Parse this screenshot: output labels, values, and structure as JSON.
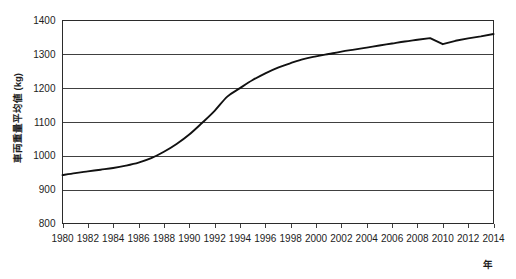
{
  "chart_data": {
    "type": "line",
    "title": "",
    "xlabel": "年",
    "ylabel": "車両重量平均値 (kg)",
    "xlim": [
      1980,
      2014
    ],
    "ylim": [
      800,
      1400
    ],
    "grid": true,
    "legend": "none",
    "y_ticks": [
      800,
      900,
      1000,
      1100,
      1200,
      1300,
      1400
    ],
    "x_ticks": [
      1980,
      1982,
      1984,
      1986,
      1988,
      1990,
      1992,
      1994,
      1996,
      1998,
      2000,
      2002,
      2004,
      2006,
      2008,
      2010,
      2012,
      2014
    ],
    "x": [
      1980,
      1981,
      1982,
      1983,
      1984,
      1985,
      1986,
      1987,
      1988,
      1989,
      1990,
      1991,
      1992,
      1993,
      1994,
      1995,
      1996,
      1997,
      1998,
      1999,
      2000,
      2001,
      2002,
      2003,
      2004,
      2005,
      2006,
      2007,
      2008,
      2009,
      2010,
      2011,
      2012,
      2013,
      2014
    ],
    "series": [
      {
        "name": "車両重量平均値",
        "color": "#111111",
        "values": [
          943,
          949,
          954,
          959,
          964,
          971,
          980,
          993,
          1012,
          1035,
          1063,
          1097,
          1133,
          1175,
          1200,
          1224,
          1244,
          1261,
          1274,
          1286,
          1294,
          1301,
          1308,
          1314,
          1320,
          1326,
          1332,
          1338,
          1343,
          1348,
          1330,
          1340,
          1347,
          1353,
          1360
        ]
      }
    ],
    "annotations": [
      {
        "year": 1993,
        "label": "inflection",
        "value": 1175
      },
      {
        "year": 2009,
        "label": "local peak",
        "value": 1348
      },
      {
        "year": 2010,
        "label": "local dip",
        "value": 1330
      }
    ]
  },
  "axes": {
    "y_tick_labels": [
      "1400",
      "1300",
      "1200",
      "1100",
      "1000",
      "900",
      "800"
    ],
    "x_tick_labels": [
      "1980",
      "1982",
      "1984",
      "1986",
      "1988",
      "1990",
      "1992",
      "1994",
      "1996",
      "1998",
      "2000",
      "2002",
      "2004",
      "2006",
      "2008",
      "2010",
      "2012",
      "2014"
    ],
    "y_axis_title": "車両重量平均値 (kg)",
    "x_axis_title": "年"
  },
  "style": {
    "line_color": "#111111",
    "grid_color": "#2b2b2b",
    "background": "#ffffff",
    "text_color": "#1d1d1d"
  }
}
